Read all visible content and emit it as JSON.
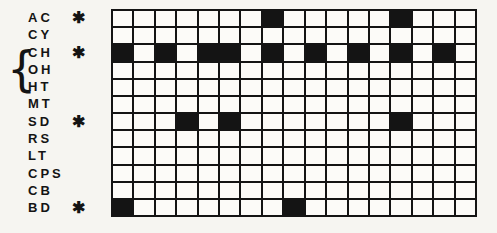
{
  "chart_data": {
    "type": "heatmap",
    "title": "",
    "rows": [
      "AC",
      "CY",
      "CH",
      "OH",
      "HT",
      "MT",
      "SD",
      "RS",
      "LT",
      "CPS",
      "CB",
      "BD"
    ],
    "starred_rows": [
      "AC",
      "CH",
      "SD",
      "BD"
    ],
    "braced_rows": [
      "CH",
      "OH"
    ],
    "n_columns": 17,
    "cell_values": "binary presence matrix, 1 = filled black cell",
    "filled_cells": {
      "AC": [
        8,
        14
      ],
      "CY": [],
      "CH": [
        1,
        3,
        5,
        6,
        8,
        10,
        12,
        14,
        16
      ],
      "OH": [],
      "HT": [],
      "MT": [],
      "SD": [
        4,
        6,
        14
      ],
      "RS": [],
      "LT": [],
      "CPS": [],
      "CB": [],
      "BD": [
        1,
        9
      ]
    },
    "legend_position": "none",
    "grid_on": true
  },
  "icons": {
    "asterisk_glyph": "✱",
    "brace_glyph": "{"
  },
  "colors": {
    "ink": "#141414",
    "paper": "#f6f5f1",
    "cell_bg": "#fcfbf8"
  },
  "row_label_tops": [
    10,
    27,
    45,
    62,
    79,
    96,
    114,
    131,
    148,
    166,
    183,
    200
  ],
  "star_row_tops": {
    "AC": 10,
    "CH": 45,
    "SD": 114,
    "BD": 200
  }
}
